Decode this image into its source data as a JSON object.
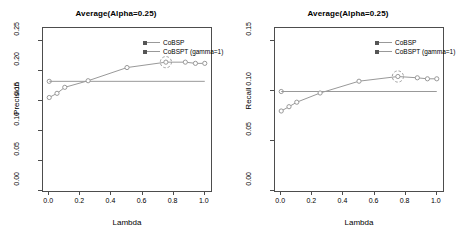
{
  "figure": {
    "panels": [
      {
        "id": "precision-panel",
        "title": "Average(Alpha=0.25)",
        "xlabel": "Lambda",
        "ylabel": "Precision",
        "xticks": [
          "0.0",
          "0.2",
          "0.4",
          "0.6",
          "0.8",
          "1.0"
        ],
        "yticks": [
          "0.00",
          "0.05",
          "0.10",
          "0.15",
          "0.20",
          "0.25"
        ],
        "legend": [
          {
            "label": "CoBSP",
            "color": "#999999",
            "marker": "square"
          },
          {
            "label": "CoBSPT (gamma=1)",
            "color": "#999999",
            "marker": "square"
          }
        ]
      },
      {
        "id": "recall-panel",
        "title": "Average(Alpha=0.25)",
        "xlabel": "Lambda",
        "ylabel": "Recall",
        "xticks": [
          "0.0",
          "0.2",
          "0.4",
          "0.6",
          "0.8",
          "1.0"
        ],
        "yticks": [
          "0.00",
          "0.05",
          "0.10",
          "0.15"
        ],
        "legend": [
          {
            "label": "CoBSP",
            "color": "#999999",
            "marker": "square"
          },
          {
            "label": "CoBSPT (gamma=1)",
            "color": "#999999",
            "marker": "square"
          }
        ]
      }
    ]
  },
  "chart_data": [
    {
      "type": "line",
      "title": "Average(Alpha=0.25)",
      "xlabel": "Lambda",
      "ylabel": "Precision",
      "xlim": [
        -0.04,
        1.04
      ],
      "ylim": [
        0.0,
        0.272
      ],
      "xticks": [
        0.0,
        0.2,
        0.4,
        0.6,
        0.8,
        1.0
      ],
      "yticks": [
        0.0,
        0.05,
        0.1,
        0.15,
        0.2,
        0.25
      ],
      "grid": false,
      "legend_position": "top-right",
      "annotations": [
        {
          "type": "circle-highlight",
          "x": 0.75,
          "y": 0.215,
          "note": "highlighted best point"
        }
      ],
      "series": [
        {
          "name": "CoBSP",
          "color": "#999999",
          "style": "horizontal-reference-line",
          "x": [
            0.0,
            1.0
          ],
          "values": [
            0.183,
            0.183
          ],
          "marker_x": [
            0.0
          ],
          "marker_values": [
            0.183
          ]
        },
        {
          "name": "CoBSPT (gamma=1)",
          "color": "#999999",
          "style": "line-with-open-circles",
          "x": [
            0.0,
            0.05,
            0.1,
            0.25,
            0.5,
            0.75,
            0.875,
            0.94,
            1.0
          ],
          "values": [
            0.156,
            0.163,
            0.173,
            0.184,
            0.206,
            0.215,
            0.215,
            0.213,
            0.213
          ]
        }
      ]
    },
    {
      "type": "line",
      "title": "Average(Alpha=0.25)",
      "xlabel": "Lambda",
      "ylabel": "Recall",
      "xlim": [
        -0.04,
        1.04
      ],
      "ylim": [
        0.0,
        0.163
      ],
      "xticks": [
        0.0,
        0.2,
        0.4,
        0.6,
        0.8,
        1.0
      ],
      "yticks": [
        0.0,
        0.05,
        0.1,
        0.15
      ],
      "grid": false,
      "legend_position": "top-right",
      "annotations": [
        {
          "type": "circle-highlight",
          "x": 0.75,
          "y": 0.1145,
          "note": "highlighted best point"
        }
      ],
      "series": [
        {
          "name": "CoBSP",
          "color": "#999999",
          "style": "horizontal-reference-line",
          "x": [
            0.0,
            1.0
          ],
          "values": [
            0.0995,
            0.0995
          ],
          "marker_x": [
            0.0
          ],
          "marker_values": [
            0.0995
          ]
        },
        {
          "name": "CoBSPT (gamma=1)",
          "color": "#999999",
          "style": "line-with-open-circles",
          "x": [
            0.0,
            0.05,
            0.1,
            0.25,
            0.5,
            0.75,
            0.875,
            0.94,
            1.0
          ],
          "values": [
            0.08,
            0.0843,
            0.0888,
            0.098,
            0.1098,
            0.1145,
            0.1132,
            0.1122,
            0.1122
          ]
        }
      ]
    }
  ]
}
